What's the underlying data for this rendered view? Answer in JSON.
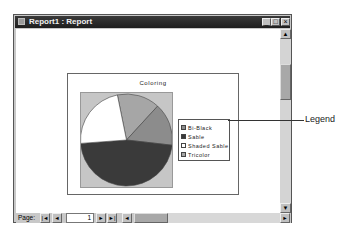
{
  "window": {
    "title": "Report1 : Report",
    "controls": {
      "minimize": "_",
      "maximize": "□",
      "close": "×"
    }
  },
  "chart_data": {
    "type": "pie",
    "title": "Coloring",
    "categories": [
      "Bi-Black",
      "Sable",
      "Shaded Sable",
      "Tricolor"
    ],
    "values": [
      15,
      47,
      23,
      15
    ],
    "unit": "percent (estimated from slice angles)",
    "colors": [
      "#8c8c8c",
      "#3a3a3a",
      "#ffffff",
      "#a6a6a6"
    ],
    "legend_position": "right",
    "xlabel": "",
    "ylabel": "",
    "grid": false
  },
  "legend": {
    "items": [
      {
        "label": "Bi-Black",
        "color": "#8c8c8c"
      },
      {
        "label": "Sable",
        "color": "#3a3a3a"
      },
      {
        "label": "Shaded Sable",
        "color": "#ffffff"
      },
      {
        "label": "Tricolor",
        "color": "#a6a6a6"
      }
    ]
  },
  "callout": {
    "label": "Legend"
  },
  "navigation": {
    "page_label": "Page:",
    "first": "|◄",
    "prev": "◄",
    "page_value": "1",
    "next": "►",
    "last": "►|"
  },
  "scrollbars": {
    "up": "▲",
    "down": "▼",
    "left": "◄",
    "right": "►"
  }
}
